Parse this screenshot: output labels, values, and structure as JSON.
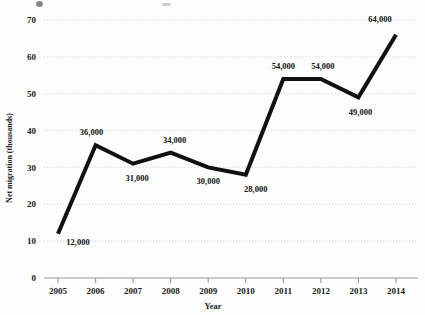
{
  "chart_data": {
    "type": "line",
    "title": "",
    "xlabel": "Year",
    "ylabel": "Net migration (thousands)",
    "categories": [
      "2005",
      "2006",
      "2007",
      "2008",
      "2009",
      "2010",
      "2011",
      "2012",
      "2013",
      "2014"
    ],
    "x": [
      2005,
      2006,
      2007,
      2008,
      2009,
      2010,
      2011,
      2012,
      2013,
      2014
    ],
    "values": [
      12,
      36,
      31,
      34,
      30,
      28,
      54,
      54,
      49,
      64
    ],
    "point_labels": [
      "12,000",
      "36,000",
      "31,000",
      "34,000",
      "30,000",
      "28,000",
      "54,000",
      "54,000",
      "49,000",
      "64,000"
    ],
    "ylim": [
      0,
      70
    ],
    "yticks": [
      0,
      10,
      20,
      30,
      40,
      50,
      60,
      70
    ],
    "ytick_labels": [
      "0",
      "10",
      "20",
      "30",
      "40",
      "50",
      "60",
      "70"
    ],
    "xlim": [
      2005,
      2014
    ],
    "grid": "horizontal-dotted",
    "legend": "none",
    "series_color": "#111111",
    "line_width_px": 4,
    "grid_color": "#c9c9c9",
    "axis_color": "#9a9a9a",
    "background": "#fdfdfd",
    "units": "thousands",
    "note_line_end_overshoot": 66
  },
  "axes": {
    "y_axis_title": "Net migration (thousands)",
    "x_axis_title": "Year"
  }
}
